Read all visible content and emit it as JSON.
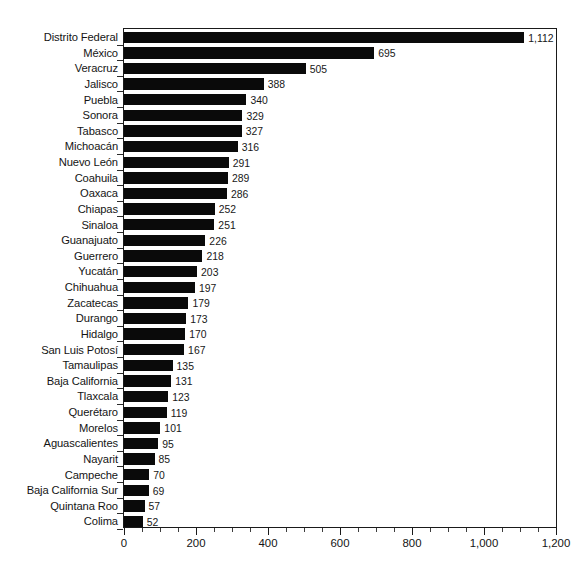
{
  "chart_data": {
    "type": "bar",
    "orientation": "horizontal",
    "title": "",
    "subtitle": "",
    "xlabel": "",
    "ylabel": "",
    "xlim": [
      0,
      1200
    ],
    "ylim": null,
    "grid": false,
    "legend": null,
    "bar_color": "#0a0a0a",
    "axis_color": "#1a1a1a",
    "background": "#ffffff",
    "xticks": [
      0,
      200,
      400,
      600,
      800,
      1000,
      1200
    ],
    "xtick_labels": [
      "0",
      "200",
      "400",
      "600",
      "800",
      "1,000",
      "1,200"
    ],
    "xtick_minor_step": 50,
    "categories": [
      "Distrito Federal",
      "México",
      "Veracruz",
      "Jalisco",
      "Puebla",
      "Sonora",
      "Tabasco",
      "Michoacán",
      "Nuevo León",
      "Coahuila",
      "Oaxaca",
      "Chiapas",
      "Sinaloa",
      "Guanajuato",
      "Guerrero",
      "Yucatán",
      "Chihuahua",
      "Zacatecas",
      "Durango",
      "Hidalgo",
      "San Luis Potosí",
      "Tamaulipas",
      "Baja California",
      "Tlaxcala",
      "Querétaro",
      "Morelos",
      "Aguascalientes",
      "Nayarit",
      "Campeche",
      "Baja California Sur",
      "Quintana Roo",
      "Colima"
    ],
    "values": [
      1112,
      695,
      505,
      388,
      340,
      329,
      327,
      316,
      291,
      289,
      286,
      252,
      251,
      226,
      218,
      203,
      197,
      179,
      173,
      170,
      167,
      135,
      131,
      123,
      119,
      101,
      95,
      85,
      70,
      69,
      57,
      52
    ],
    "value_labels": [
      "1,112",
      "695",
      "505",
      "388",
      "340",
      "329",
      "327",
      "316",
      "291",
      "289",
      "286",
      "252",
      "251",
      "226",
      "218",
      "203",
      "197",
      "179",
      "173",
      "170",
      "167",
      "135",
      "131",
      "123",
      "119",
      "101",
      "95",
      "85",
      "70",
      "69",
      "57",
      "52"
    ]
  },
  "footnote": ""
}
